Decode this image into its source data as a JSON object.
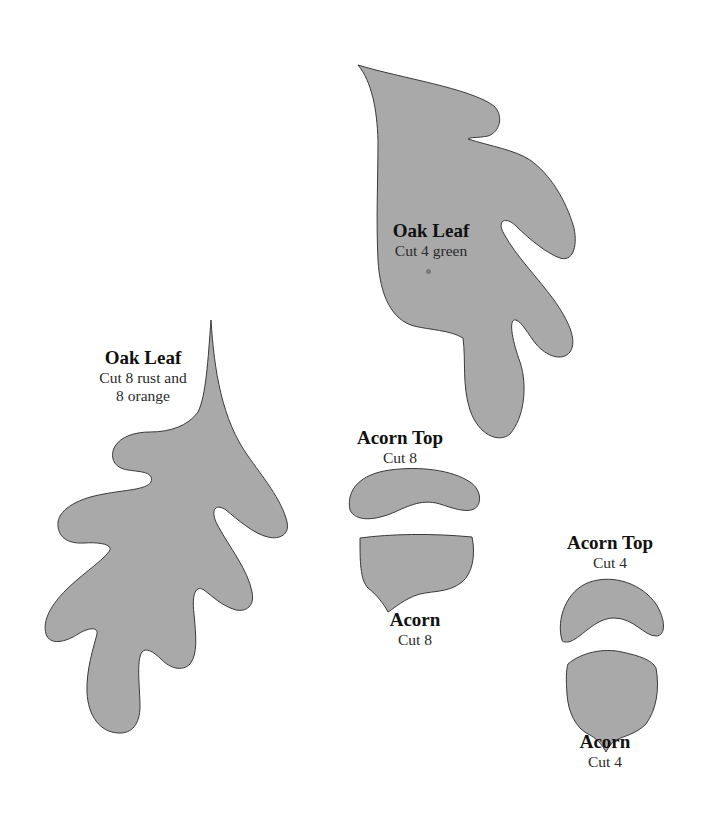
{
  "page": {
    "background": "#ffffff",
    "shape_fill": "#a9a9a9",
    "shape_stroke": "#3a3a3a"
  },
  "patterns": {
    "oak_leaf_large": {
      "title": "Oak Leaf",
      "instruction": "Cut 4 green"
    },
    "oak_leaf_small": {
      "title": "Oak Leaf",
      "instruction_line1": "Cut 8 rust and",
      "instruction_line2": "8 orange"
    },
    "acorn_top_large": {
      "title": "Acorn Top",
      "instruction": "Cut 8"
    },
    "acorn_large": {
      "title": "Acorn",
      "instruction": "Cut 8"
    },
    "acorn_top_small": {
      "title": "Acorn Top",
      "instruction": "Cut 4"
    },
    "acorn_small": {
      "title": "Acorn",
      "instruction": "Cut 4"
    }
  }
}
